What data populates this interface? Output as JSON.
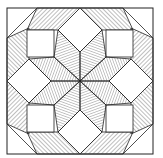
{
  "figure": {
    "frame": {
      "x": 7,
      "y": 8,
      "width": 146,
      "height": 146
    },
    "center": [
      80,
      81
    ],
    "colors": {
      "line": "#222222",
      "hatch": "#444444",
      "fill": "#ffffff"
    }
  }
}
